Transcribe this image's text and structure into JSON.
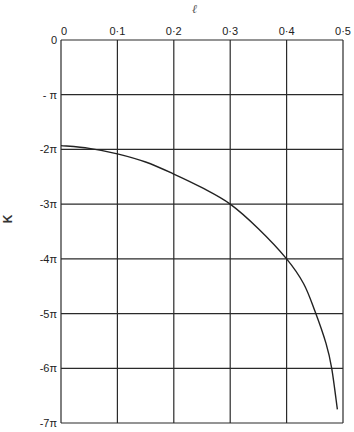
{
  "chart_data": {
    "type": "line",
    "title": "",
    "xlabel": "ℓ",
    "ylabel": "K",
    "xlim": [
      0,
      0.5
    ],
    "ylim_pi_units": [
      -7,
      0
    ],
    "x_ticks": [
      "0",
      "0·1",
      "0·2",
      "0·3",
      "0·4",
      "0·5"
    ],
    "y_ticks": [
      "0",
      "- π",
      "-2π",
      "-3π",
      "-4π",
      "-5π",
      "-6π",
      "-7π"
    ],
    "grid": true,
    "x_axis_position": "top",
    "series": [
      {
        "name": "K(ℓ)",
        "x": [
          0,
          0.05,
          0.1,
          0.15,
          0.2,
          0.25,
          0.3,
          0.35,
          0.4,
          0.43,
          0.45,
          0.47,
          0.48,
          0.49
        ],
        "y_pi_units": [
          -1.93,
          -1.98,
          -2.08,
          -2.23,
          -2.45,
          -2.7,
          -3.0,
          -3.45,
          -4.0,
          -4.45,
          -4.95,
          -5.55,
          -6.0,
          -6.75
        ]
      }
    ]
  },
  "labels": {
    "x_axis": "ℓ",
    "y_axis": "K"
  }
}
